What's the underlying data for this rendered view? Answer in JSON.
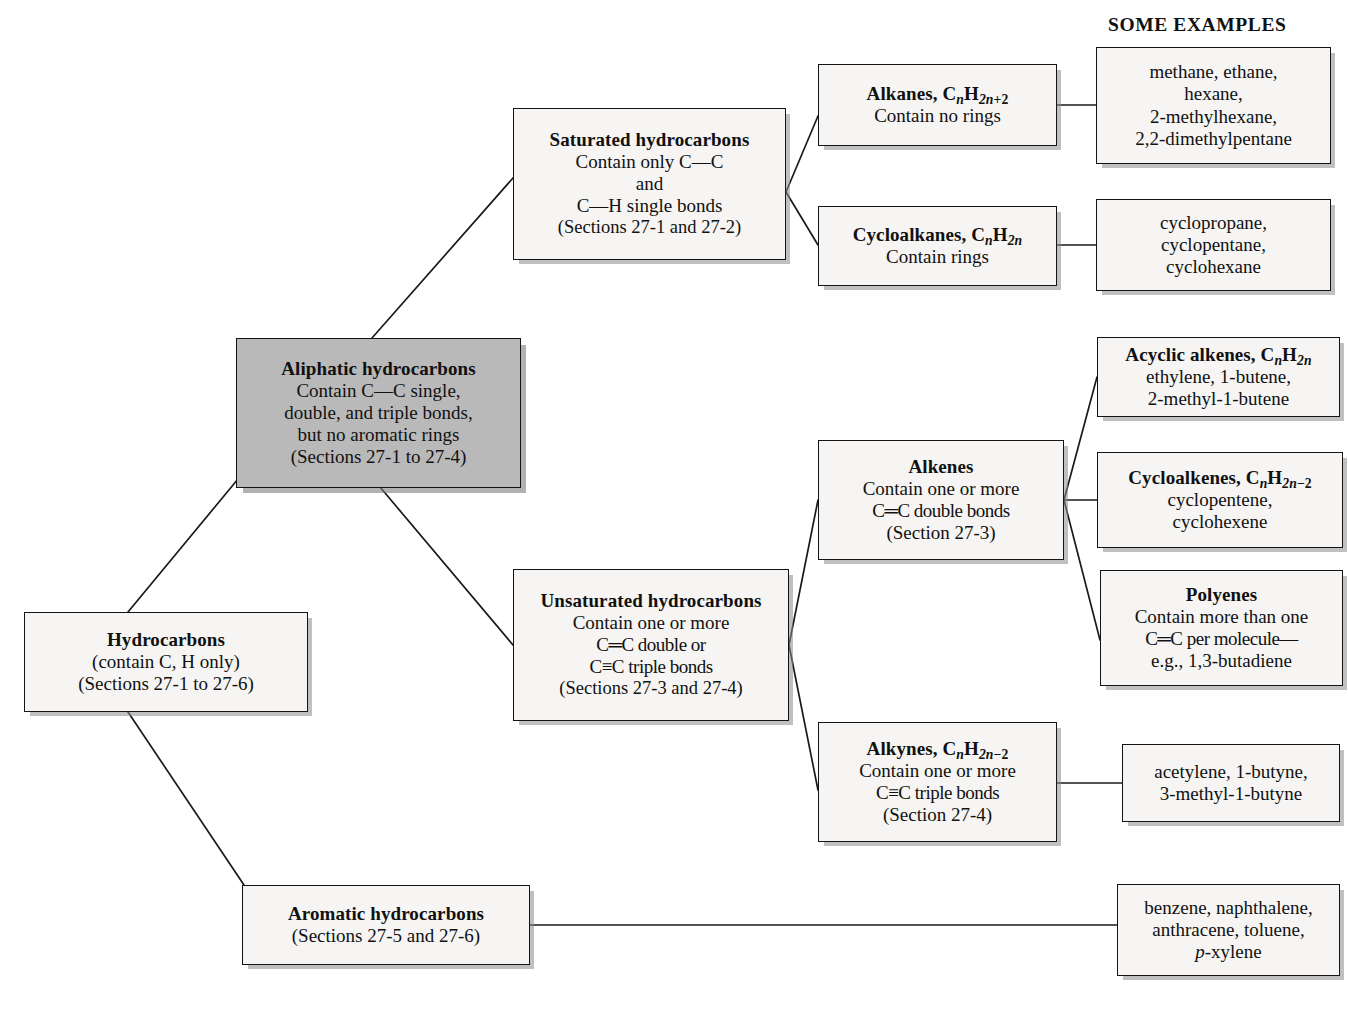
{
  "heading": {
    "label": "SOME EXAMPLES"
  },
  "colors": {
    "highlight_fill": "#b9b9b9",
    "box_fill": "#f6f5f3",
    "border": "#141414",
    "text": "#111111",
    "shadow": "#8c8c8c"
  },
  "nodes": {
    "hydrocarbons": {
      "name": "hydrocarbons",
      "title": "Hydrocarbons",
      "lines": [
        "(contain C, H only)",
        "(Sections 27-1 to 27-6)"
      ],
      "filled": false
    },
    "aliphatic": {
      "name": "aliphatic-hydrocarbons",
      "title": "Aliphatic hydrocarbons",
      "lines": [
        "Contain C—C single,",
        "double, and triple bonds,",
        "but no aromatic rings",
        "(Sections 27-1 to 27-4)"
      ],
      "filled": true
    },
    "aromatic": {
      "name": "aromatic-hydrocarbons",
      "title": "Aromatic hydrocarbons",
      "lines": [
        "(Sections 27-5 and 27-6)"
      ],
      "filled": false
    },
    "saturated": {
      "name": "saturated-hydrocarbons",
      "title": "Saturated hydrocarbons",
      "lines": [
        "Contain only C—C",
        "and",
        "C—H single bonds",
        "(Sections 27-1 and 27-2)"
      ],
      "filled": false
    },
    "unsaturated": {
      "name": "unsaturated-hydrocarbons",
      "title": "Unsaturated hydrocarbons",
      "lines": [
        "Contain one or more",
        "C═C double or",
        "C≡C triple bonds",
        "(Sections 27-3 and 27-4)"
      ],
      "filled": false
    },
    "alkanes": {
      "name": "alkanes",
      "title_html": "Alkanes, C<sub class=\"it\">n</sub>H<sub><span class=\"it\">2n</span>+2</sub>",
      "title_plain": "Alkanes, CnH2n+2",
      "lines": [
        "Contain no rings"
      ],
      "filled": false
    },
    "cycloalkanes": {
      "name": "cycloalkanes",
      "title_html": "Cycloalkanes, C<sub class=\"it\">n</sub>H<sub class=\"it\">2n</sub>",
      "title_plain": "Cycloalkanes, CnH2n",
      "lines": [
        "Contain rings"
      ],
      "filled": false
    },
    "alkenes": {
      "name": "alkenes",
      "title": "Alkenes",
      "lines": [
        "Contain one or more",
        "C═C double bonds",
        "(Section 27-3)"
      ],
      "filled": false
    },
    "alkynes": {
      "name": "alkynes",
      "title_html": "Alkynes, C<sub class=\"it\">n</sub>H<sub><span class=\"it\">2n</span>−2</sub>",
      "title_plain": "Alkynes, CnH2n-2",
      "lines": [
        "Contain one or more",
        "C≡C triple bonds",
        "(Section 27-4)"
      ],
      "filled": false
    },
    "acyclic_alkenes": {
      "name": "acyclic-alkenes",
      "title_html": "Acyclic alkenes, C<sub class=\"it\">n</sub>H<sub class=\"it\">2n</sub>",
      "title_plain": "Acyclic alkenes, CnH2n",
      "lines": [
        "ethylene, 1-butene,",
        "2-methyl-1-butene"
      ],
      "filled": false
    },
    "cycloalkenes": {
      "name": "cycloalkenes",
      "title_html": "Cycloalkenes, C<sub class=\"it\">n</sub>H<sub><span class=\"it\">2n</span>−2</sub>",
      "title_plain": "Cycloalkenes, CnH2n-2",
      "lines": [
        "cyclopentene,",
        "cyclohexene"
      ],
      "filled": false
    },
    "polyenes": {
      "name": "polyenes",
      "title": "Polyenes",
      "lines": [
        "Contain more than one",
        "C═C per molecule—",
        "e.g., 1,3-butadiene"
      ],
      "filled": false
    }
  },
  "examples": {
    "alkanes": {
      "name": "example-alkanes",
      "lines": [
        "methane, ethane,",
        "hexane,",
        "2-methylhexane,",
        "2,2-dimethylpentane"
      ]
    },
    "cycloalkanes": {
      "name": "example-cycloalkanes",
      "lines": [
        "cyclopropane,",
        "cyclopentane,",
        "cyclohexane"
      ]
    },
    "alkynes": {
      "name": "example-alkynes",
      "lines": [
        "acetylene, 1-butyne,",
        "3-methyl-1-butyne"
      ]
    },
    "aromatic": {
      "name": "example-aromatic",
      "lines_html": [
        "benzene, naphthalene,",
        "anthracene, toluene,",
        "<span class=\"it\">p</span>-xylene"
      ],
      "lines_plain": [
        "benzene, naphthalene,",
        "anthracene, toluene,",
        "p-xylene"
      ]
    }
  },
  "connectors": [
    {
      "name": "hydrocarbons-to-aliphatic",
      "from": "hydrocarbons",
      "to": "aliphatic"
    },
    {
      "name": "hydrocarbons-to-aromatic",
      "from": "hydrocarbons",
      "to": "aromatic"
    },
    {
      "name": "aliphatic-to-saturated",
      "from": "aliphatic",
      "to": "saturated"
    },
    {
      "name": "aliphatic-to-unsaturated",
      "from": "aliphatic",
      "to": "unsaturated"
    },
    {
      "name": "saturated-to-alkanes",
      "from": "saturated",
      "to": "alkanes"
    },
    {
      "name": "saturated-to-cycloalkanes",
      "from": "saturated",
      "to": "cycloalkanes"
    },
    {
      "name": "unsaturated-to-alkenes",
      "from": "unsaturated",
      "to": "alkenes"
    },
    {
      "name": "unsaturated-to-alkynes",
      "from": "unsaturated",
      "to": "alkynes"
    },
    {
      "name": "alkanes-to-example",
      "from": "alkanes",
      "to": "example-alkanes"
    },
    {
      "name": "cycloalkanes-to-example",
      "from": "cycloalkanes",
      "to": "example-cycloalkanes"
    },
    {
      "name": "alkenes-to-acyclic-alkenes",
      "from": "alkenes",
      "to": "acyclic_alkenes"
    },
    {
      "name": "alkenes-to-cycloalkenes",
      "from": "alkenes",
      "to": "cycloalkenes"
    },
    {
      "name": "alkenes-to-polyenes",
      "from": "alkenes",
      "to": "polyenes"
    },
    {
      "name": "alkynes-to-example",
      "from": "alkynes",
      "to": "example-alkynes"
    },
    {
      "name": "aromatic-to-example",
      "from": "aromatic",
      "to": "example-aromatic"
    }
  ]
}
